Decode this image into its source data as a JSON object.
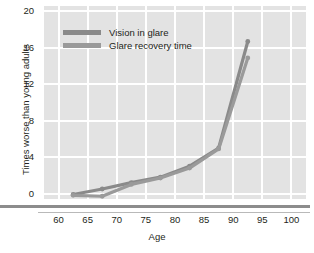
{
  "chart_data": {
    "type": "line",
    "title": "",
    "subtitle": "",
    "xlabel": "Age",
    "ylabel": "Times worse than young adults",
    "xlim": [
      57.5,
      102.5
    ],
    "ylim": [
      -0.6,
      20.6
    ],
    "xticks": [
      60,
      65,
      70,
      75,
      80,
      85,
      90,
      95,
      100
    ],
    "yticks": [
      0,
      4,
      8,
      12,
      16,
      20
    ],
    "grid": true,
    "legend_position": "top-left-inside",
    "x": [
      62.5,
      67.5,
      72.5,
      77.5,
      82.5,
      87.5,
      92.5
    ],
    "series": [
      {
        "name": "Vision in glare",
        "color": "#8a8a8a",
        "values": [
          -0.1,
          0.5,
          1.2,
          1.8,
          3.0,
          5.0,
          16.7
        ]
      },
      {
        "name": "Glare recovery time",
        "color": "#9a9a9a",
        "values": [
          -0.2,
          -0.3,
          1.0,
          1.7,
          2.8,
          4.9,
          14.9
        ]
      }
    ]
  },
  "axes": {
    "y_title": "Times worse than young adults",
    "x_title": "Age",
    "y_tick_labels": [
      "20",
      "16",
      "12",
      "8",
      "4",
      "0"
    ],
    "x_tick_labels": [
      "60",
      "65",
      "70",
      "75",
      "80",
      "85",
      "90",
      "95",
      "100"
    ]
  },
  "legend": {
    "items": [
      {
        "label": "Vision in glare",
        "color": "#8a8a8a"
      },
      {
        "label": "Glare recovery time",
        "color": "#9a9a9a"
      }
    ]
  },
  "colors": {
    "plot_background": "#e3e3e3",
    "gridline": "#ffffff",
    "axis_rule": "#8c8c8c",
    "text": "#231f20"
  }
}
